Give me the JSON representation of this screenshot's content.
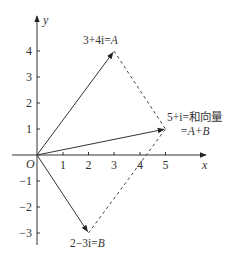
{
  "diagram": {
    "type": "complex-plane-vector-addition",
    "axes": {
      "x_label": "x",
      "y_label": "y",
      "origin_label": "O",
      "x_ticks": [
        "1",
        "2",
        "3",
        "4",
        "5"
      ],
      "y_ticks_positive": [
        "1",
        "2",
        "3",
        "4"
      ],
      "y_ticks_negative": [
        "−1",
        "−2",
        "−3"
      ]
    },
    "points": {
      "A": {
        "coords": [
          3,
          4
        ],
        "label": "3+4i=",
        "name": "A"
      },
      "B": {
        "coords": [
          2,
          -3
        ],
        "label": "2−3i=",
        "name": "B"
      },
      "sum": {
        "coords": [
          5,
          1
        ],
        "label_line1": "5+i=和向量",
        "label_line2": "=A+B"
      }
    },
    "vectors": [
      {
        "from": "O",
        "to": "A",
        "style": "solid-arrow"
      },
      {
        "from": "O",
        "to": "B",
        "style": "solid-arrow"
      },
      {
        "from": "O",
        "to": "A+B",
        "style": "solid-arrow"
      },
      {
        "from": "A",
        "to": "A+B",
        "style": "dashed"
      },
      {
        "from": "B",
        "to": "A+B",
        "style": "dashed"
      }
    ],
    "colors": {
      "line": "#333333",
      "text": "#333333",
      "background": "#ffffff"
    }
  }
}
